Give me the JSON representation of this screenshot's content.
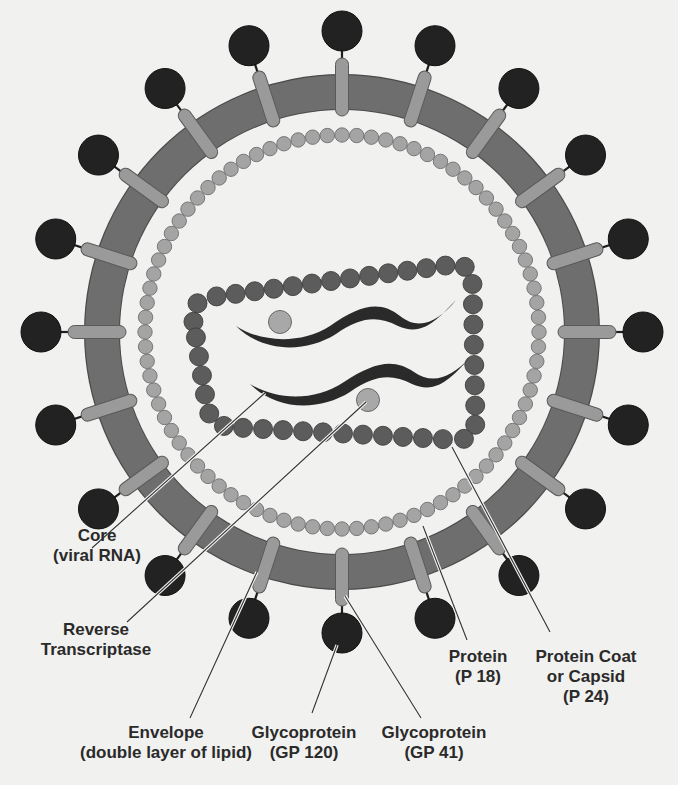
{
  "diagram": {
    "colors": {
      "background": "#f1f1ef",
      "envelope": "#6e6e6e",
      "envelope_stroke": "#4a4a4a",
      "stem": "#9a9a9a",
      "spike_head": "#222222",
      "matrix_bead": "#a4a4a4",
      "capsid_bead": "#5c5c5c",
      "rna": "#2a2a2a",
      "enzyme": "#a8a8a8",
      "leader_line": "#333333",
      "text": "#2a2a2a"
    },
    "geometry": {
      "center": [
        342,
        332
      ],
      "envelope_outer_radius": 258,
      "envelope_inner_radius": 222,
      "spike_count": 20,
      "spike_head_radius": 20,
      "spike_head_distance": 301,
      "matrix_ring_radius": 197,
      "matrix_bead_radius": 7.2,
      "capsid_corners": [
        [
          190,
          300
        ],
        [
          472,
          262
        ],
        [
          476,
          441
        ],
        [
          210,
          426
        ]
      ],
      "capsid_bead_radius": 9.5,
      "enzymes": [
        [
          280,
          322
        ],
        [
          368,
          400
        ]
      ]
    }
  },
  "labels": [
    {
      "id": "core",
      "lines": [
        "Core",
        "(viral RNA)"
      ],
      "pos": [
        55,
        528
      ],
      "anchor_from": [
        92,
        548
      ],
      "anchor_to": [
        265,
        393
      ]
    },
    {
      "id": "reverse-transcriptase",
      "lines": [
        "Reverse",
        "Transcriptase"
      ],
      "pos": [
        40,
        620
      ],
      "anchor_from": [
        127,
        622
      ],
      "anchor_to": [
        366,
        402
      ]
    },
    {
      "id": "envelope",
      "lines": [
        "Envelope",
        "(double layer of lipid)"
      ],
      "pos": [
        72,
        717
      ],
      "anchor_from": [
        190,
        718
      ],
      "anchor_to": [
        257,
        572
      ]
    },
    {
      "id": "gp120",
      "lines": [
        "Glycoprotein",
        "(GP 120)"
      ],
      "pos": [
        255,
        717
      ],
      "anchor_from": [
        312,
        713
      ],
      "anchor_to": [
        337,
        645
      ]
    },
    {
      "id": "gp41",
      "lines": [
        "Glycoprotein",
        "(GP 41)"
      ],
      "pos": [
        380,
        719
      ],
      "anchor_from": [
        421,
        718
      ],
      "anchor_to": [
        345,
        596
      ]
    },
    {
      "id": "p18",
      "lines": [
        "Protein",
        "(P 18)"
      ],
      "pos": [
        450,
        643
      ],
      "anchor_from": [
        467,
        640
      ],
      "anchor_to": [
        423,
        526
      ]
    },
    {
      "id": "p24",
      "lines": [
        "Protein Coat",
        "or Capsid",
        "(P 24)"
      ],
      "pos": [
        530,
        643
      ],
      "anchor_from": [
        550,
        632
      ],
      "anchor_to": [
        452,
        447
      ]
    }
  ]
}
